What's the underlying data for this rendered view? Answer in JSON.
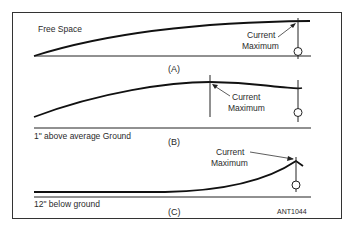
{
  "figure": {
    "id_label": "ANT1044",
    "panels": [
      {
        "caption": "(A)",
        "condition": "Free Space",
        "annotation": [
          "Current",
          "Maximum"
        ]
      },
      {
        "caption": "(B)",
        "condition": "1\" above average Ground",
        "annotation": [
          "Current",
          "Maximum"
        ]
      },
      {
        "caption": "(C)",
        "condition": "12\" below ground",
        "annotation": [
          "Current",
          "Maximum"
        ]
      }
    ]
  },
  "colors": {
    "line": "#1a1a1a",
    "frame": "#333333",
    "background": "#ffffff"
  }
}
